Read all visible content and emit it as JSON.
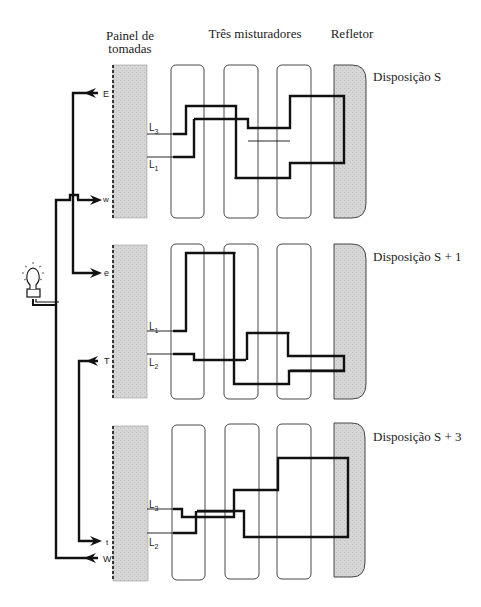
{
  "headers": {
    "panel_line1": "Painel de",
    "panel_line2": "tomadas",
    "mixers": "Três misturadores",
    "reflector": "Refletor"
  },
  "arrangements": [
    {
      "label": "Disposição S",
      "ports": {
        "top": "E",
        "bottom": "w"
      },
      "lines": {
        "upper": "L",
        "upper_sub": "3",
        "lower": "L",
        "lower_sub": "1"
      }
    },
    {
      "label": "Disposição S + 1",
      "ports": {
        "top": "e",
        "bottom": "T"
      },
      "lines": {
        "upper": "L",
        "upper_sub": "1",
        "lower": "L",
        "lower_sub": "2"
      }
    },
    {
      "label": "Disposição S + 3",
      "ports": {
        "top": "t",
        "bottom": "W"
      },
      "lines": {
        "upper": "L",
        "upper_sub": "3",
        "lower": "L",
        "lower_sub": "2"
      }
    }
  ],
  "colors": {
    "panel_fill": "#d4d4d4",
    "reflector_fill": "#cfcfcf",
    "line": "#111111",
    "mixer_stroke": "#333333"
  }
}
